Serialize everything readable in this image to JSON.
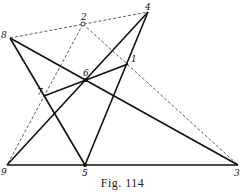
{
  "figure": {
    "caption": "Fig. 114",
    "points": {
      "1": {
        "label": "1",
        "x": 128,
        "y": 64
      },
      "2": {
        "label": "2",
        "x": 83,
        "y": 24
      },
      "3": {
        "label": "3",
        "x": 238,
        "y": 165
      },
      "4": {
        "label": "4",
        "x": 148,
        "y": 12
      },
      "5": {
        "label": "5",
        "x": 85,
        "y": 165
      },
      "6": {
        "label": "6",
        "x": 86,
        "y": 80
      },
      "7": {
        "label": "7",
        "x": 44,
        "y": 96
      },
      "8": {
        "label": "8",
        "x": 10,
        "y": 38
      },
      "9": {
        "label": "9",
        "x": 7,
        "y": 165
      }
    },
    "solid_lines": [
      [
        "9",
        "3"
      ],
      [
        "8",
        "3"
      ],
      [
        "8",
        "5"
      ],
      [
        "9",
        "4"
      ],
      [
        "5",
        "4"
      ],
      [
        "7",
        "1"
      ]
    ],
    "dashed_lines": [
      [
        "8",
        "4"
      ],
      [
        "2",
        "9"
      ],
      [
        "2",
        "3"
      ]
    ],
    "filled_points": [
      "5",
      "6"
    ],
    "open_points": [
      "2"
    ]
  }
}
